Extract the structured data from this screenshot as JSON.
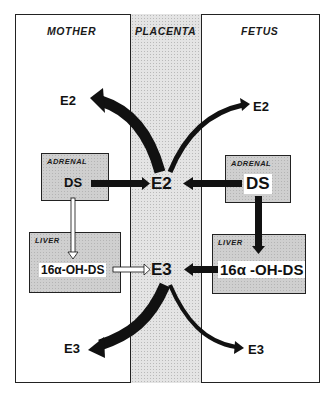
{
  "columns": {
    "mother": "MOTHER",
    "placenta": "PLACENTA",
    "fetus": "FETUS"
  },
  "mother": {
    "adrenal": {
      "title": "ADRENAL",
      "compound": "DS"
    },
    "liver": {
      "title": "LIVER",
      "compound": "16α-OH-DS"
    },
    "e2_out": "E2",
    "e3_out": "E3"
  },
  "placenta": {
    "e2": "E2",
    "e3": "E3"
  },
  "fetus": {
    "adrenal": {
      "title": "ADRENAL",
      "compound": "DS"
    },
    "liver": {
      "title": "LIVER",
      "compound": "16α -OH-DS"
    },
    "e2_out": "E2",
    "e3_out": "E3"
  },
  "flows": [
    {
      "from": "mother.adrenal.DS",
      "to": "placenta.E2",
      "style": "thick-black"
    },
    {
      "from": "fetus.adrenal.DS",
      "to": "placenta.E2",
      "style": "thick-black"
    },
    {
      "from": "mother.adrenal.DS",
      "to": "mother.liver.16a-OH-DS",
      "style": "thin-hollow"
    },
    {
      "from": "fetus.adrenal.DS",
      "to": "fetus.liver.16a-OH-DS",
      "style": "thick-black"
    },
    {
      "from": "mother.liver.16a-OH-DS",
      "to": "placenta.E3",
      "style": "thin-hollow"
    },
    {
      "from": "fetus.liver.16a-OH-DS",
      "to": "placenta.E3",
      "style": "thick-black"
    },
    {
      "from": "placenta.E2",
      "to": "mother.E2",
      "style": "thick-curved"
    },
    {
      "from": "placenta.E2",
      "to": "fetus.E2",
      "style": "thin-curved"
    },
    {
      "from": "placenta.E3",
      "to": "mother.E3",
      "style": "thick-curved"
    },
    {
      "from": "placenta.E3",
      "to": "fetus.E3",
      "style": "thin-curved"
    }
  ],
  "colors": {
    "line": "#111111",
    "box_fill": "#cfcfcf",
    "placenta_fill": "#e4e4e4"
  }
}
